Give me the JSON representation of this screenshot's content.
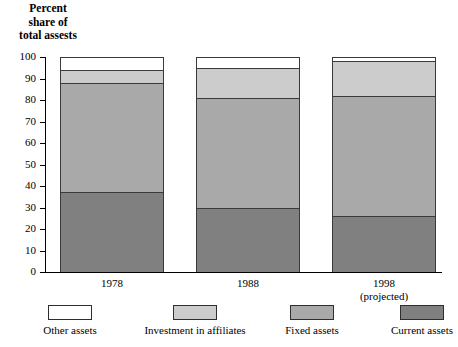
{
  "chart_data": {
    "type": "bar",
    "subtype": "stacked-bar-100",
    "title": "",
    "ylabel": "Percent share of total assests",
    "ylabel_lines": [
      "Percent",
      "share of",
      "total assests"
    ],
    "xlabel": "",
    "categories": [
      "1978",
      "1988",
      "1998"
    ],
    "category_sublabels": [
      "",
      "",
      "(projected)"
    ],
    "ylim": [
      0,
      100
    ],
    "yticks": [
      0,
      10,
      20,
      30,
      40,
      50,
      60,
      70,
      80,
      90,
      100
    ],
    "ytick_labels": [
      "0",
      "10",
      "20",
      "30",
      "40",
      "50",
      "60",
      "70",
      "80",
      "90",
      "100"
    ],
    "grid": false,
    "legend_position": "bottom",
    "series": [
      {
        "name": "Current assets",
        "color": "#808080",
        "values": [
          37,
          30,
          26
        ]
      },
      {
        "name": "Fixed assets",
        "color": "#a9a9a9",
        "values": [
          51,
          51,
          56
        ]
      },
      {
        "name": "Investment in affiliates",
        "color": "#cccccc",
        "values": [
          6,
          14,
          16
        ]
      },
      {
        "name": "Other assets",
        "color": "#ffffff",
        "values": [
          6,
          5,
          2
        ]
      }
    ],
    "stack_order_bottom_to_top": [
      "Current assets",
      "Fixed assets",
      "Investment in affiliates",
      "Other assets"
    ],
    "cumulative_tops": {
      "1978": {
        "Current assets": 37,
        "Fixed assets": 88,
        "Investment in affiliates": 94,
        "Other assets": 100
      },
      "1988": {
        "Current assets": 30,
        "Fixed assets": 81,
        "Investment in affiliates": 95,
        "Other assets": 100
      },
      "1998": {
        "Current assets": 26,
        "Fixed assets": 82,
        "Investment in affiliates": 98,
        "Other assets": 100
      }
    }
  },
  "legend": {
    "items": [
      {
        "label": "Other assets",
        "color": "#ffffff"
      },
      {
        "label": "Investment in affiliates",
        "color": "#cccccc"
      },
      {
        "label": "Fixed assets",
        "color": "#a9a9a9"
      },
      {
        "label": "Current assets",
        "color": "#808080"
      }
    ]
  }
}
